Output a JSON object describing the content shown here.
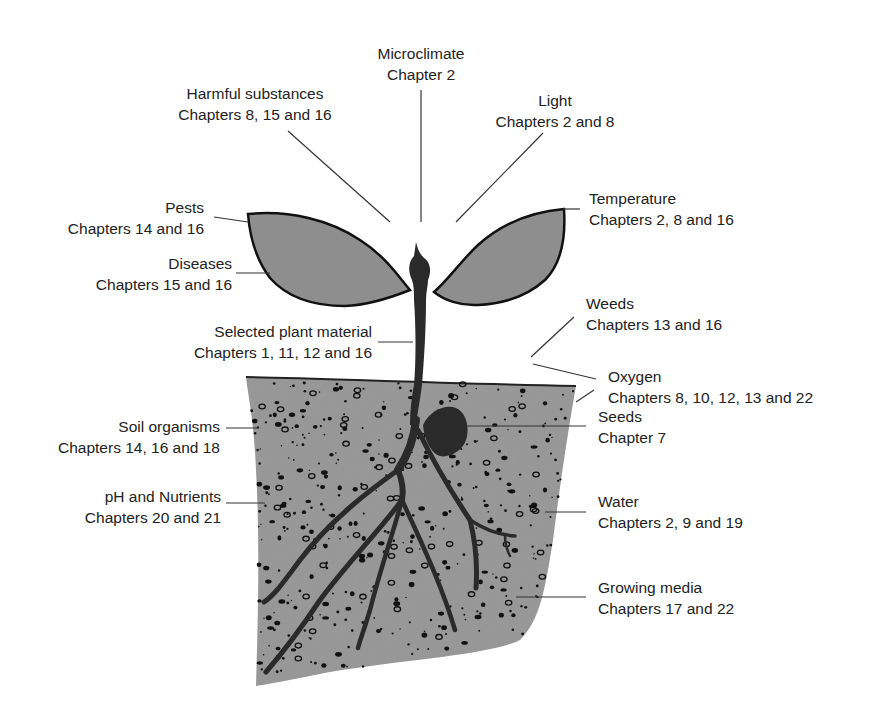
{
  "diagram": {
    "colors": {
      "soil": "#9c9c9c",
      "leaf": "#8e8e8e",
      "stem": "#2a2a2a",
      "outline": "#111111",
      "leader": "#333333"
    },
    "labels": {
      "microclimate": {
        "name": "Microclimate",
        "chapters": "Chapter 2"
      },
      "harmful": {
        "name": "Harmful substances",
        "chapters": "Chapters 8, 15 and 16"
      },
      "light": {
        "name": "Light",
        "chapters": "Chapters 2 and 8"
      },
      "pests": {
        "name": "Pests",
        "chapters": "Chapters 14  and 16"
      },
      "temperature": {
        "name": "Temperature",
        "chapters": "Chapters 2, 8 and 16"
      },
      "diseases": {
        "name": "Diseases",
        "chapters": "Chapters 15 and 16"
      },
      "plant_material": {
        "name": "Selected plant material",
        "chapters": "Chapters 1, 11, 12 and 16"
      },
      "weeds": {
        "name": "Weeds",
        "chapters": "Chapters 13 and 16"
      },
      "oxygen": {
        "name": "Oxygen",
        "chapters": "Chapters 8, 10, 12, 13 and 22"
      },
      "seeds": {
        "name": "Seeds",
        "chapters": "Chapter 7"
      },
      "soil_organisms": {
        "name": "Soil organisms",
        "chapters": "Chapters 14, 16 and 18"
      },
      "ph_nutrients": {
        "name": "pH and Nutrients",
        "chapters": "Chapters 20 and 21"
      },
      "water": {
        "name": "Water",
        "chapters": "Chapters 2, 9 and 19"
      },
      "growing_media": {
        "name": "Growing media",
        "chapters": "Chapters 17 and 22"
      }
    }
  }
}
